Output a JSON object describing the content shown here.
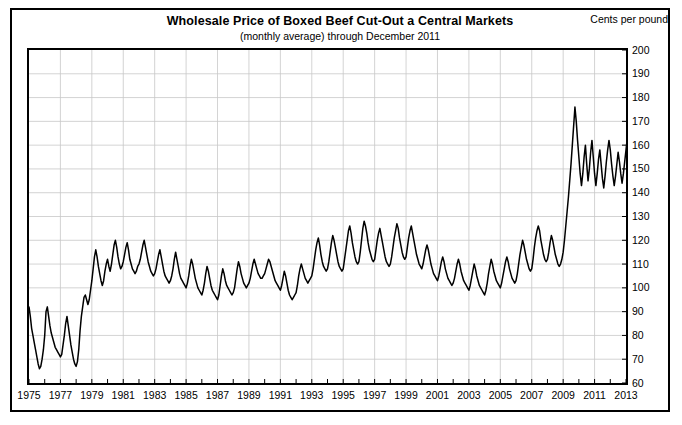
{
  "header": {
    "title": "Wholesale Price of Boxed Beef Cut-Out a Central Markets",
    "subtitle": "(monthly average) through December 2011",
    "units_label": "Cents per pound"
  },
  "colors": {
    "line": "#000000",
    "grid": "#c8c8c8",
    "frame": "#000000",
    "background": "#ffffff"
  },
  "chart_data": {
    "type": "line",
    "title": "Wholesale Price of Boxed Beef Cut-Out a Central Markets",
    "subtitle": "(monthly average) through December 2011",
    "xlabel": "",
    "ylabel": "Cents per pound",
    "xlim": [
      1975,
      2013
    ],
    "ylim": [
      60,
      200
    ],
    "grid": true,
    "legend": "none",
    "x_tick_labels": [
      "1975",
      "1977",
      "1979",
      "1981",
      "1983",
      "1985",
      "1987",
      "1989",
      "1991",
      "1993",
      "1995",
      "1997",
      "1999",
      "2001",
      "2003",
      "2005",
      "2007",
      "2009",
      "2011",
      "2013"
    ],
    "x_tick_values": [
      1975,
      1977,
      1979,
      1981,
      1983,
      1985,
      1987,
      1989,
      1991,
      1993,
      1995,
      1997,
      1999,
      2001,
      2003,
      2005,
      2007,
      2009,
      2011,
      2013
    ],
    "x_minor_tick_values": [
      1976,
      1978,
      1980,
      1982,
      1984,
      1986,
      1988,
      1990,
      1992,
      1994,
      1996,
      1998,
      2000,
      2002,
      2004,
      2006,
      2008,
      2010,
      2012
    ],
    "y_tick_labels": [
      "60",
      "70",
      "80",
      "90",
      "100",
      "110",
      "120",
      "130",
      "140",
      "150",
      "160",
      "170",
      "180",
      "190",
      "200"
    ],
    "y_tick_values": [
      60,
      70,
      80,
      90,
      100,
      110,
      120,
      130,
      140,
      150,
      160,
      170,
      180,
      190,
      200
    ],
    "series": [
      {
        "name": "Boxed Beef Cut-Out Value",
        "x_start": 1975.0,
        "x_step": 0.08333333,
        "units": "cents per pound",
        "values": [
          92,
          88,
          83,
          80,
          77,
          74,
          71,
          68,
          66,
          67,
          70,
          74,
          80,
          90,
          92,
          88,
          84,
          81,
          79,
          77,
          75,
          74,
          73,
          72,
          71,
          72,
          76,
          80,
          85,
          88,
          84,
          80,
          76,
          73,
          70,
          68,
          67,
          69,
          74,
          82,
          88,
          92,
          96,
          97,
          95,
          93,
          95,
          99,
          103,
          108,
          113,
          116,
          113,
          109,
          106,
          103,
          101,
          103,
          107,
          110,
          112,
          109,
          107,
          110,
          114,
          118,
          120,
          117,
          113,
          110,
          108,
          109,
          111,
          114,
          117,
          119,
          116,
          112,
          110,
          108,
          107,
          106,
          107,
          109,
          110,
          112,
          115,
          118,
          120,
          117,
          114,
          111,
          109,
          107,
          106,
          105,
          106,
          108,
          111,
          114,
          116,
          113,
          110,
          107,
          105,
          104,
          103,
          102,
          103,
          105,
          108,
          112,
          115,
          112,
          109,
          106,
          104,
          103,
          102,
          101,
          100,
          102,
          105,
          109,
          112,
          110,
          107,
          104,
          102,
          100,
          99,
          98,
          97,
          99,
          102,
          106,
          109,
          107,
          104,
          101,
          99,
          98,
          97,
          96,
          95,
          97,
          101,
          105,
          108,
          106,
          103,
          101,
          100,
          99,
          98,
          97,
          98,
          100,
          104,
          108,
          111,
          109,
          106,
          104,
          102,
          101,
          100,
          101,
          102,
          104,
          107,
          110,
          112,
          110,
          108,
          106,
          105,
          104,
          104,
          105,
          106,
          108,
          110,
          112,
          111,
          109,
          107,
          105,
          103,
          102,
          101,
          100,
          99,
          101,
          104,
          107,
          105,
          102,
          99,
          97,
          96,
          95,
          96,
          97,
          98,
          101,
          105,
          108,
          110,
          108,
          106,
          104,
          103,
          102,
          103,
          104,
          105,
          108,
          112,
          116,
          119,
          121,
          118,
          114,
          111,
          109,
          108,
          107,
          108,
          111,
          115,
          119,
          122,
          120,
          117,
          114,
          111,
          109,
          108,
          107,
          108,
          112,
          116,
          120,
          124,
          126,
          123,
          119,
          116,
          113,
          111,
          110,
          111,
          115,
          120,
          125,
          128,
          126,
          123,
          119,
          116,
          114,
          112,
          111,
          112,
          116,
          120,
          123,
          125,
          122,
          119,
          116,
          113,
          111,
          110,
          109,
          110,
          113,
          117,
          121,
          124,
          127,
          125,
          121,
          118,
          115,
          113,
          112,
          113,
          117,
          121,
          124,
          126,
          123,
          120,
          117,
          114,
          112,
          110,
          109,
          108,
          110,
          113,
          116,
          118,
          116,
          113,
          110,
          108,
          106,
          105,
          104,
          103,
          105,
          108,
          111,
          113,
          111,
          108,
          106,
          104,
          103,
          102,
          101,
          102,
          104,
          107,
          110,
          112,
          110,
          107,
          105,
          103,
          102,
          101,
          100,
          99,
          101,
          104,
          107,
          110,
          108,
          105,
          103,
          101,
          100,
          99,
          98,
          97,
          99,
          102,
          106,
          109,
          112,
          110,
          107,
          105,
          103,
          102,
          101,
          100,
          102,
          105,
          108,
          111,
          113,
          111,
          108,
          106,
          104,
          103,
          102,
          103,
          106,
          110,
          114,
          117,
          120,
          118,
          115,
          112,
          110,
          108,
          107,
          108,
          112,
          117,
          121,
          124,
          126,
          124,
          120,
          117,
          114,
          112,
          111,
          112,
          115,
          119,
          122,
          120,
          117,
          114,
          112,
          110,
          109,
          110,
          112,
          115,
          120,
          126,
          132,
          138,
          145,
          152,
          160,
          168,
          176,
          170,
          162,
          155,
          148,
          143,
          148,
          155,
          160,
          152,
          145,
          150,
          157,
          162,
          155,
          148,
          143,
          148,
          154,
          158,
          152,
          146,
          142,
          147,
          153,
          158,
          162,
          158,
          152,
          147,
          143,
          147,
          152,
          157,
          153,
          148,
          144,
          148,
          153,
          158,
          163,
          168,
          164,
          158,
          153,
          149,
          145,
          148,
          152,
          156,
          152,
          148,
          145,
          149,
          154,
          158,
          154,
          150,
          146,
          143,
          145,
          149,
          153,
          150,
          146,
          143,
          141,
          144,
          148,
          152,
          156,
          160,
          157,
          153,
          149,
          146,
          143,
          141,
          140,
          142,
          145,
          143,
          141,
          140,
          142,
          145,
          148,
          146,
          143,
          141,
          140,
          142,
          145,
          148,
          152,
          156,
          160,
          163,
          161,
          158,
          160,
          163,
          161,
          158,
          156,
          159,
          163,
          167,
          165,
          162,
          160,
          163,
          167,
          172,
          176,
          180,
          178,
          175,
          172,
          176,
          181,
          186,
          190,
          194,
          196,
          192,
          188,
          192,
          196
        ]
      }
    ]
  }
}
